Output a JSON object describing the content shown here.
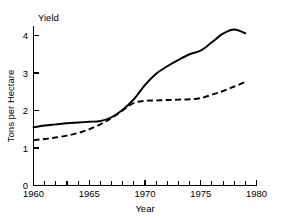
{
  "chart_data": {
    "type": "line",
    "title": "",
    "corner_label": "Yield",
    "xlabel": "Year",
    "ylabel": "Tons per Hectare",
    "xlim": [
      1960,
      1980
    ],
    "ylim": [
      0,
      4.4
    ],
    "grid": false,
    "legend": "none",
    "x_ticks_major": [
      1960,
      1965,
      1970,
      1975,
      1980
    ],
    "x_tick_labels": [
      "1960",
      "1965",
      "1970",
      "1975",
      "1980"
    ],
    "x_ticks_minor": [
      1961,
      1962,
      1963,
      1964,
      1966,
      1967,
      1968,
      1969,
      1971,
      1972,
      1973,
      1974,
      1976,
      1977,
      1978,
      1979
    ],
    "y_ticks": [
      0,
      1,
      2,
      3,
      4
    ],
    "y_tick_labels": [
      "0",
      "1",
      "2",
      "3",
      "4"
    ],
    "series": [
      {
        "name": "solid-curve",
        "style": "solid",
        "color": "#000000",
        "x": [
          1960,
          1961,
          1962,
          1963,
          1964,
          1965,
          1966,
          1967,
          1968,
          1969,
          1970,
          1971,
          1972,
          1973,
          1974,
          1975,
          1976,
          1977,
          1978,
          1979
        ],
        "values": [
          1.55,
          1.6,
          1.63,
          1.66,
          1.68,
          1.7,
          1.72,
          1.82,
          2.02,
          2.3,
          2.68,
          2.98,
          3.18,
          3.35,
          3.5,
          3.6,
          3.82,
          4.05,
          4.16,
          4.06
        ]
      },
      {
        "name": "dashed-curve",
        "style": "dashed",
        "color": "#000000",
        "x": [
          1960,
          1961,
          1962,
          1963,
          1964,
          1965,
          1966,
          1967,
          1968,
          1969,
          1970,
          1971,
          1972,
          1973,
          1974,
          1975,
          1976,
          1977,
          1978,
          1979
        ],
        "values": [
          1.21,
          1.24,
          1.28,
          1.33,
          1.4,
          1.5,
          1.63,
          1.8,
          2.0,
          2.2,
          2.26,
          2.27,
          2.28,
          2.29,
          2.3,
          2.33,
          2.42,
          2.52,
          2.64,
          2.76
        ]
      }
    ],
    "annotations": []
  }
}
